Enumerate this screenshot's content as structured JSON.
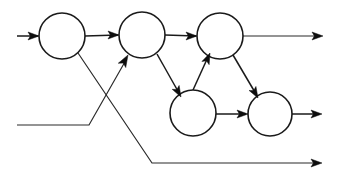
{
  "diagram": {
    "type": "directed-graph",
    "canvas": {
      "width": 337,
      "height": 180,
      "background": "#ffffff"
    },
    "style": {
      "node_fill": "#ffffff",
      "node_stroke": "#1a1a1a",
      "node_stroke_width": 1.6,
      "edge_stroke": "#1a1a1a",
      "edge_stroke_width": 1.5,
      "arrow_fill": "#0d0d0d"
    },
    "nodes": [
      {
        "id": "n1",
        "label": "",
        "cx": 62,
        "cy": 36,
        "r": 23
      },
      {
        "id": "n2",
        "label": "",
        "cx": 142,
        "cy": 35,
        "r": 23
      },
      {
        "id": "n3",
        "label": "",
        "cx": 220,
        "cy": 36,
        "r": 23
      },
      {
        "id": "n4",
        "label": "",
        "cx": 193,
        "cy": 113,
        "r": 23
      },
      {
        "id": "n5",
        "label": "",
        "cx": 270,
        "cy": 114,
        "r": 22
      }
    ],
    "edges": [
      {
        "id": "e-in1",
        "from": "external-input-top",
        "to": "n1",
        "kind": "input",
        "arrow": true,
        "points": "17,36 38,36"
      },
      {
        "id": "e-n1-n2",
        "from": "n1",
        "to": "n2",
        "kind": "internal",
        "arrow": true,
        "points": "85,36 118,35"
      },
      {
        "id": "e-n2-n3",
        "from": "n2",
        "to": "n3",
        "kind": "internal",
        "arrow": true,
        "points": "165,35 196,36"
      },
      {
        "id": "e-n3-out",
        "from": "n3",
        "to": "external-output-top",
        "kind": "output",
        "arrow": true,
        "points": "243,36 318,36"
      },
      {
        "id": "e-n2-n4",
        "from": "n2",
        "to": "n4",
        "kind": "internal",
        "arrow": true,
        "points": "157,54 179,93"
      },
      {
        "id": "e-n4-n3",
        "from": "n4",
        "to": "n3",
        "kind": "internal",
        "arrow": true,
        "points": "193,90 208,57"
      },
      {
        "id": "e-n3-n5",
        "from": "n3",
        "to": "n5",
        "kind": "internal",
        "arrow": true,
        "points": "233,55 256,94"
      },
      {
        "id": "e-n4-n5",
        "from": "n4",
        "to": "n5",
        "kind": "internal",
        "arrow": true,
        "points": "216,114 246,114"
      },
      {
        "id": "e-n5-out",
        "from": "n5",
        "to": "external-output-middle",
        "kind": "output",
        "arrow": true,
        "points": "292,114 317,114"
      },
      {
        "id": "e-in2-n2",
        "from": "external-input-bottom",
        "to": "n2",
        "kind": "input-crossing",
        "arrow": true,
        "points": "17,125 89,125 126,60"
      },
      {
        "id": "e-n1-out",
        "from": "n1",
        "to": "external-output-bottom",
        "kind": "output-crossing",
        "arrow": true,
        "points": "78,53 152,163 316,163"
      }
    ],
    "arrowheads": [
      {
        "id": "a-in1",
        "for": "e-in1",
        "tip_x": 39,
        "tip_y": 36,
        "angle_deg": 0,
        "size": 11
      },
      {
        "id": "a-n1-n2",
        "for": "e-n1-n2",
        "tip_x": 119,
        "tip_y": 35,
        "angle_deg": 0,
        "size": 11
      },
      {
        "id": "a-n2-n3",
        "for": "e-n2-n3",
        "tip_x": 197,
        "tip_y": 36,
        "angle_deg": 0,
        "size": 11
      },
      {
        "id": "a-n3-out",
        "for": "e-n3-out",
        "tip_x": 323,
        "tip_y": 36,
        "angle_deg": 0,
        "size": 11
      },
      {
        "id": "a-n2-n4",
        "for": "e-n2-n4",
        "tip_x": 181,
        "tip_y": 97,
        "angle_deg": 61,
        "size": 11
      },
      {
        "id": "a-n4-n3",
        "for": "e-n4-n3",
        "tip_x": 210,
        "tip_y": 53,
        "angle_deg": -66,
        "size": 11
      },
      {
        "id": "a-n3-n5",
        "for": "e-n3-n5",
        "tip_x": 258,
        "tip_y": 98,
        "angle_deg": 60,
        "size": 11
      },
      {
        "id": "a-n4-n5",
        "for": "e-n4-n5",
        "tip_x": 248,
        "tip_y": 114,
        "angle_deg": 0,
        "size": 11
      },
      {
        "id": "a-n5-out",
        "for": "e-n5-out",
        "tip_x": 322,
        "tip_y": 114,
        "angle_deg": 0,
        "size": 11
      },
      {
        "id": "a-in2-n2",
        "for": "e-in2-n2",
        "tip_x": 128,
        "tip_y": 55,
        "angle_deg": -60,
        "size": 12
      },
      {
        "id": "a-n1-out",
        "for": "e-n1-out",
        "tip_x": 322,
        "tip_y": 163,
        "angle_deg": 0,
        "size": 11
      }
    ]
  }
}
